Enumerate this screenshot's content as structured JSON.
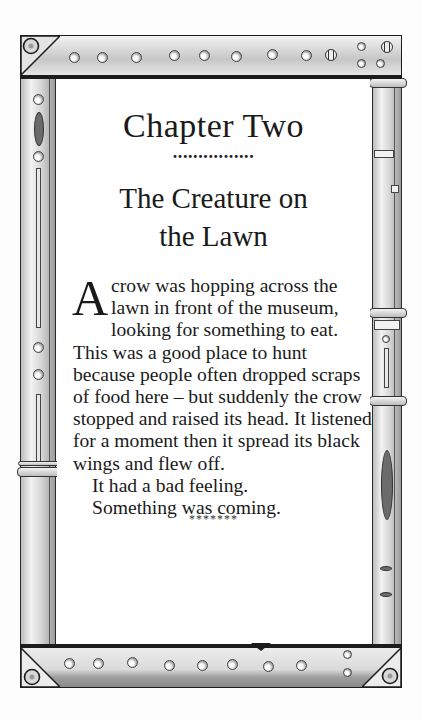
{
  "chapter": {
    "number_label": "Chapter Two",
    "separator": "................",
    "title_line_1": "The Creature on",
    "title_line_2": "the Lawn"
  },
  "body": {
    "drop_cap": "A",
    "paragraph_1": " crow was hopping across the lawn in front of the museum, looking for something to eat. This was a good place to hunt because people often dropped scraps of food here – but suddenly the crow stopped and raised its head. It listened for a moment then it spread its black wings and flew off.",
    "paragraph_2": "It had a bad feeling.",
    "paragraph_3": "Something was coming.",
    "scene_break": "*******"
  },
  "frame": {
    "style": "riveted-metal",
    "colors": {
      "outline": "#1c1c1c",
      "metal_light": "#f3f3f3",
      "metal_mid": "#d0d0d0",
      "metal_dark": "#8a8a8a",
      "oval_accent": "#6b6b6b",
      "page": "#ffffff"
    },
    "top_rivets": 8,
    "bottom_rivets": 8,
    "icons": [
      "rivet-icon",
      "screw-icon",
      "corner-bracket-icon",
      "oval-inset-icon"
    ]
  }
}
